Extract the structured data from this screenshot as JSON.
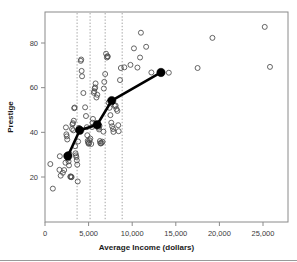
{
  "chart_data": {
    "type": "scatter",
    "title": "",
    "xlabel": "Average Income (dollars)",
    "ylabel": "Prestige",
    "xlim": [
      0,
      27000
    ],
    "ylim": [
      12,
      90
    ],
    "grid": false,
    "legend": null,
    "xticks": [
      0,
      5000,
      10000,
      15000,
      20000,
      25000
    ],
    "xticklabels": [
      "0",
      "5,000",
      "10,000",
      "15,000",
      "20,000",
      "25,000"
    ],
    "yticks": [
      20,
      40,
      60,
      80
    ],
    "yticklabels": [
      "20",
      "40",
      "60",
      "80"
    ],
    "series": [
      {
        "name": "observations",
        "marker": "open-circle",
        "color": "#4a4a4a",
        "points": [
          [
            611,
            25.8
          ],
          [
            900,
            14.8
          ],
          [
            1656,
            23.2
          ],
          [
            1700,
            29.3
          ],
          [
            1800,
            20.6
          ],
          [
            2050,
            21.9
          ],
          [
            2200,
            23.1
          ],
          [
            2350,
            26.4
          ],
          [
            2400,
            42.2
          ],
          [
            2450,
            39.1
          ],
          [
            2500,
            38.2
          ],
          [
            2550,
            36.8
          ],
          [
            2600,
            28.2
          ],
          [
            2700,
            27.0
          ],
          [
            2750,
            25.2
          ],
          [
            2800,
            30.4
          ],
          [
            2900,
            20.1
          ],
          [
            2950,
            20.3
          ],
          [
            3000,
            19.9
          ],
          [
            3050,
            20.0
          ],
          [
            3100,
            41.5
          ],
          [
            3150,
            43.6
          ],
          [
            3200,
            44.1
          ],
          [
            3250,
            40.9
          ],
          [
            3300,
            45.2
          ],
          [
            3350,
            50.8
          ],
          [
            3400,
            51.1
          ],
          [
            3450,
            33.8
          ],
          [
            3500,
            30.6
          ],
          [
            3550,
            29.7
          ],
          [
            3600,
            28.9
          ],
          [
            3650,
            27.5
          ],
          [
            3700,
            25.5
          ],
          [
            3750,
            18.0
          ],
          [
            3800,
            35.9
          ],
          [
            3850,
            41.2
          ],
          [
            3900,
            42.0
          ],
          [
            4100,
            72.0
          ],
          [
            4150,
            72.6
          ],
          [
            4200,
            67.5
          ],
          [
            4250,
            65.1
          ],
          [
            4400,
            57.6
          ],
          [
            4600,
            51.2
          ],
          [
            4700,
            47.3
          ],
          [
            4800,
            42.3
          ],
          [
            4850,
            38.7
          ],
          [
            4900,
            36.2
          ],
          [
            4950,
            35.5
          ],
          [
            5000,
            34.9
          ],
          [
            5050,
            35.1
          ],
          [
            5100,
            36.5
          ],
          [
            5200,
            37.2
          ],
          [
            5300,
            34.8
          ],
          [
            5400,
            42.4
          ],
          [
            5450,
            44.3
          ],
          [
            5500,
            46.0
          ],
          [
            5600,
            57.7
          ],
          [
            5650,
            58.4
          ],
          [
            5700,
            59.6
          ],
          [
            5750,
            60.1
          ],
          [
            5800,
            61.9
          ],
          [
            5900,
            55.6
          ],
          [
            6000,
            56.8
          ],
          [
            6100,
            43.5
          ],
          [
            6150,
            42.1
          ],
          [
            6200,
            41.3
          ],
          [
            6250,
            42.9
          ],
          [
            6300,
            36.1
          ],
          [
            6350,
            35.2
          ],
          [
            6400,
            35.0
          ],
          [
            6500,
            35.3
          ],
          [
            6600,
            35.8
          ],
          [
            6700,
            40.3
          ],
          [
            6750,
            59.6
          ],
          [
            6800,
            62.6
          ],
          [
            6900,
            66.1
          ],
          [
            7000,
            75.2
          ],
          [
            7100,
            73.5
          ],
          [
            7150,
            74.1
          ],
          [
            7200,
            73.9
          ],
          [
            7300,
            53.3
          ],
          [
            7400,
            51.0
          ],
          [
            7500,
            47.7
          ],
          [
            7600,
            44.3
          ],
          [
            7700,
            42.7
          ],
          [
            7800,
            41.5
          ],
          [
            7850,
            40.2
          ],
          [
            8000,
            51.8
          ],
          [
            8100,
            52.0
          ],
          [
            8200,
            50.4
          ],
          [
            8300,
            49.6
          ],
          [
            8400,
            43.2
          ],
          [
            8450,
            40.5
          ],
          [
            8600,
            63.4
          ],
          [
            8700,
            68.8
          ],
          [
            9100,
            69.1
          ],
          [
            9800,
            70.2
          ],
          [
            10200,
            77.6
          ],
          [
            10600,
            69.0
          ],
          [
            10900,
            73.5
          ],
          [
            11000,
            84.6
          ],
          [
            11600,
            78.3
          ],
          [
            12200,
            66.8
          ],
          [
            14200,
            66.7
          ],
          [
            17500,
            68.8
          ],
          [
            19200,
            82.3
          ],
          [
            25200,
            87.2
          ],
          [
            25800,
            69.3
          ]
        ]
      },
      {
        "name": "binned-mean-fit",
        "marker": "filled-circle",
        "color": "#000000",
        "points": [
          [
            2620,
            29.4
          ],
          [
            3980,
            40.9
          ],
          [
            5980,
            43.4
          ],
          [
            7650,
            54.2
          ],
          [
            13300,
            66.8
          ]
        ]
      }
    ],
    "annotations": {
      "vertical_dotted_lines": {
        "color": "#9a9a9a",
        "style": "dotted",
        "x_values": [
          3680,
          5170,
          6900,
          8850
        ]
      }
    }
  }
}
